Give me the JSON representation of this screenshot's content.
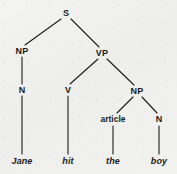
{
  "diagram": {
    "kind": "syntax-tree",
    "sentence": "Jane hit the boy",
    "ink_color": "#1b1b1b",
    "background_color": "#f1f1ef",
    "nodes": [
      {
        "id": "s",
        "label": "S",
        "x": 66,
        "y": 13,
        "style": "category"
      },
      {
        "id": "np1",
        "label": "NP",
        "x": 22,
        "y": 51,
        "style": "category"
      },
      {
        "id": "vp",
        "label": "VP",
        "x": 102,
        "y": 53,
        "style": "category"
      },
      {
        "id": "n1",
        "label": "N",
        "x": 22,
        "y": 90,
        "style": "category"
      },
      {
        "id": "v",
        "label": "V",
        "x": 68,
        "y": 90,
        "style": "category"
      },
      {
        "id": "np2",
        "label": "NP",
        "x": 137,
        "y": 91,
        "style": "category"
      },
      {
        "id": "article",
        "label": "article",
        "x": 113,
        "y": 119,
        "style": "category-lower"
      },
      {
        "id": "n2",
        "label": "N",
        "x": 159,
        "y": 119,
        "style": "category"
      },
      {
        "id": "jane",
        "label": "Jane",
        "x": 22,
        "y": 161,
        "style": "leaf"
      },
      {
        "id": "hit",
        "label": "hit",
        "x": 68,
        "y": 161,
        "style": "leaf"
      },
      {
        "id": "the",
        "label": "the",
        "x": 113,
        "y": 161,
        "style": "leaf"
      },
      {
        "id": "boy",
        "label": "boy",
        "x": 159,
        "y": 161,
        "style": "leaf"
      }
    ],
    "edges": [
      {
        "id": "edge-s-np1",
        "from": "s",
        "to": "np1",
        "x1": 61,
        "y1": 19,
        "x2": 25,
        "y2": 45
      },
      {
        "id": "edge-s-vp",
        "from": "s",
        "to": "vp",
        "x1": 71,
        "y1": 19,
        "x2": 99,
        "y2": 47
      },
      {
        "id": "edge-np1-n1",
        "from": "np1",
        "to": "n1",
        "x1": 22,
        "y1": 57,
        "x2": 22,
        "y2": 84
      },
      {
        "id": "edge-vp-v",
        "from": "vp",
        "to": "v",
        "x1": 98,
        "y1": 59,
        "x2": 70,
        "y2": 84
      },
      {
        "id": "edge-vp-np2",
        "from": "vp",
        "to": "np2",
        "x1": 107,
        "y1": 59,
        "x2": 134,
        "y2": 85
      },
      {
        "id": "edge-np2-article",
        "from": "np2",
        "to": "article",
        "x1": 133,
        "y1": 97,
        "x2": 117,
        "y2": 113
      },
      {
        "id": "edge-np2-n2",
        "from": "np2",
        "to": "n2",
        "x1": 142,
        "y1": 97,
        "x2": 157,
        "y2": 113
      },
      {
        "id": "edge-n1-jane",
        "from": "n1",
        "to": "jane",
        "x1": 22,
        "y1": 96,
        "x2": 22,
        "y2": 154
      },
      {
        "id": "edge-v-hit",
        "from": "v",
        "to": "hit",
        "x1": 68,
        "y1": 96,
        "x2": 68,
        "y2": 154
      },
      {
        "id": "edge-article-the",
        "from": "article",
        "to": "the",
        "x1": 113,
        "y1": 126,
        "x2": 113,
        "y2": 154
      },
      {
        "id": "edge-n2-boy",
        "from": "n2",
        "to": "boy",
        "x1": 159,
        "y1": 126,
        "x2": 159,
        "y2": 154
      }
    ]
  }
}
